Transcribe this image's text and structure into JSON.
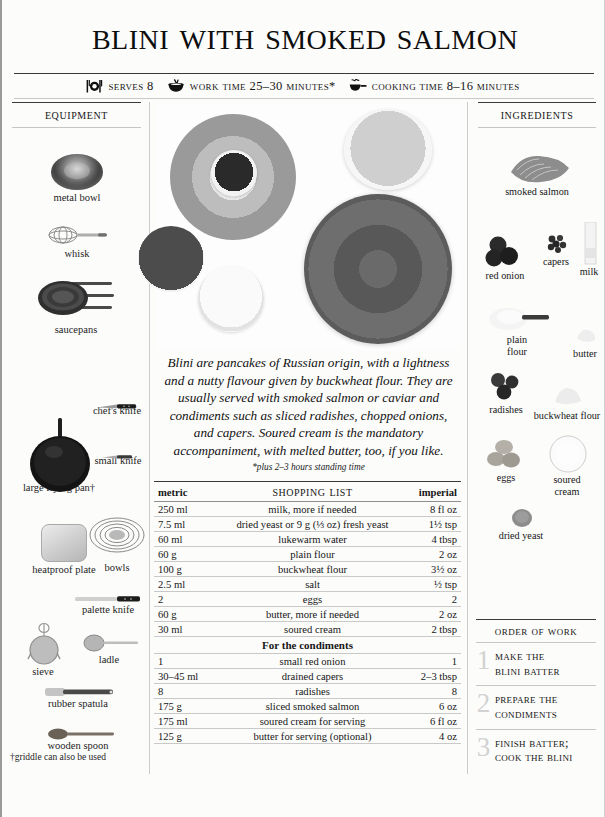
{
  "recipe": {
    "title": "Blini with Smoked Salmon",
    "intro": "Blini are pancakes of Russian origin, with a lightness and a nutty flavour given by buckwheat flour. They are usually served with smoked salmon or caviar and condiments such as sliced radishes, chopped onions, and capers. Soured cream is the mandatory accompaniment, with melted butter, too, if you like.",
    "intro_note": "*plus 2–3 hours standing time"
  },
  "meta": [
    {
      "icon": "place-setting-icon",
      "label": "Serves 8"
    },
    {
      "icon": "mixing-bowl-whisk-icon",
      "label": "Work Time 25–30 minutes*"
    },
    {
      "icon": "steaming-pan-icon",
      "label": "Cooking Time 8–16 minutes"
    }
  ],
  "equipment": {
    "heading": "Equipment",
    "items": [
      {
        "name": "metal-bowl",
        "label": "metal bowl"
      },
      {
        "name": "whisk",
        "label": "whisk"
      },
      {
        "name": "saucepans",
        "label": "saucepans"
      },
      {
        "name": "chefs-knife",
        "label": "chef's knife"
      },
      {
        "name": "small-knife",
        "label": "small knife"
      },
      {
        "name": "large-frying-pan",
        "label": "large frying pan†"
      },
      {
        "name": "bowls",
        "label": "bowls"
      },
      {
        "name": "heatproof-plate",
        "label": "heatproof plate"
      },
      {
        "name": "palette-knife",
        "label": "palette knife"
      },
      {
        "name": "sieve",
        "label": "sieve"
      },
      {
        "name": "ladle",
        "label": "ladle"
      },
      {
        "name": "rubber-spatula",
        "label": "rubber spatula"
      },
      {
        "name": "wooden-spoon",
        "label": "wooden spoon"
      }
    ],
    "footnote": "†griddle can also be used"
  },
  "ingredients": {
    "heading": "Ingredients",
    "items": [
      {
        "name": "smoked-salmon",
        "label": "smoked salmon"
      },
      {
        "name": "red-onion",
        "label": "red onion"
      },
      {
        "name": "capers",
        "label": "capers"
      },
      {
        "name": "milk",
        "label": "milk"
      },
      {
        "name": "plain-flour",
        "label": "plain\nflour"
      },
      {
        "name": "butter",
        "label": "butter"
      },
      {
        "name": "radishes",
        "label": "radishes"
      },
      {
        "name": "buckwheat-flour",
        "label": "buckwheat flour"
      },
      {
        "name": "eggs",
        "label": "eggs"
      },
      {
        "name": "soured-cream",
        "label": "soured\ncream"
      },
      {
        "name": "dried-yeast",
        "label": "dried yeast"
      }
    ]
  },
  "shopping_list": {
    "title": "Shopping List",
    "col_metric": "metric",
    "col_imperial": "imperial",
    "subhead": "For the condiments",
    "rows": [
      {
        "metric": "250 ml",
        "item": "milk, more if needed",
        "imperial": "8 fl oz"
      },
      {
        "metric": "7.5 ml",
        "item": "dried yeast or 9 g (⅓ oz) fresh yeast",
        "imperial": "1½ tsp"
      },
      {
        "metric": "60 ml",
        "item": "lukewarm water",
        "imperial": "4 tbsp"
      },
      {
        "metric": "60 g",
        "item": "plain flour",
        "imperial": "2 oz"
      },
      {
        "metric": "100 g",
        "item": "buckwheat flour",
        "imperial": "3½ oz"
      },
      {
        "metric": "2.5 ml",
        "item": "salt",
        "imperial": "½ tsp"
      },
      {
        "metric": "2",
        "item": "eggs",
        "imperial": "2"
      },
      {
        "metric": "60 g",
        "item": "butter, more if needed",
        "imperial": "2 oz"
      },
      {
        "metric": "30 ml",
        "item": "soured cream",
        "imperial": "2 tbsp"
      }
    ],
    "condiment_rows": [
      {
        "metric": "1",
        "item": "small red onion",
        "imperial": "1"
      },
      {
        "metric": "30–45 ml",
        "item": "drained capers",
        "imperial": "2–3 tbsp"
      },
      {
        "metric": "8",
        "item": "radishes",
        "imperial": "8"
      },
      {
        "metric": "175 g",
        "item": "sliced smoked salmon",
        "imperial": "6 oz"
      },
      {
        "metric": "175 ml",
        "item": "soured cream for serving",
        "imperial": "6 fl oz"
      },
      {
        "metric": "125 g",
        "item": "butter for serving (optional)",
        "imperial": "4 oz"
      }
    ]
  },
  "order_of_work": {
    "heading": "Order of Work",
    "steps": [
      {
        "num": "1",
        "text": "Make the\nBlini Batter"
      },
      {
        "num": "2",
        "text": "Prepare the\nCondiments"
      },
      {
        "num": "3",
        "text": "Finish Batter;\nCook the Blini"
      }
    ]
  },
  "colors": {
    "page_bg": "#fcfcfb",
    "rule_strong": "#3a3a3a",
    "rule_light": "#c8c8c8",
    "step_number": "#d2d2d2"
  }
}
